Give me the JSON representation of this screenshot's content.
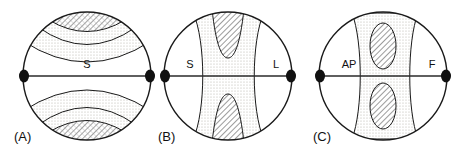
{
  "figure": {
    "caption_style": "three-stereonet-diagram",
    "background_color": "#ffffff",
    "outline_color": "#1a1a1a",
    "stipple_color": "#e8e6e2",
    "hatch_color": "#4a4a4a",
    "pole_color": "#111111"
  },
  "panels": [
    {
      "id": "A",
      "label": "(A)",
      "center_x": 87,
      "center_y": 76,
      "radius": 64,
      "axis_labels": {
        "left": "",
        "center": "S",
        "right": ""
      },
      "girdle_orientation": "horizontal-girdle",
      "max_density_position": "top-and-bottom",
      "description": "point maxima at top and bottom with concentric contour bands"
    },
    {
      "id": "B",
      "label": "(B)",
      "center_x": 228,
      "center_y": 76,
      "radius": 64,
      "axis_labels": {
        "left": "S",
        "center": "",
        "right": "L"
      },
      "girdle_orientation": "vertical-girdle",
      "max_density_position": "top-and-bottom-wedges",
      "description": "hourglass shaped vertical girdle with hatched wedges top and bottom"
    },
    {
      "id": "C",
      "label": "(C)",
      "center_x": 383,
      "center_y": 76,
      "radius": 64,
      "axis_labels": {
        "left": "AP",
        "center": "",
        "right": "F"
      },
      "girdle_orientation": "vertical-girdle",
      "max_density_position": "two-ellipse-maxima",
      "description": "vertical girdle band with two hatched elliptical maxima above and below center"
    }
  ]
}
